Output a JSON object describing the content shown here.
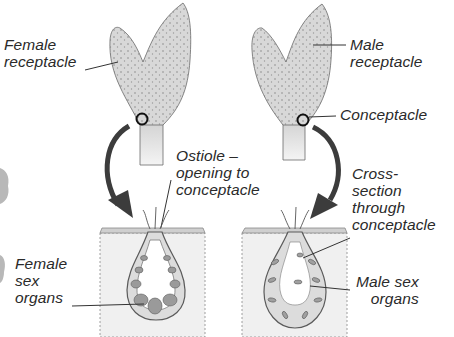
{
  "diagram": {
    "labels": {
      "female_receptacle": "Female\nreceptacle",
      "male_receptacle": "Male\nreceptacle",
      "conceptacle": "Conceptacle",
      "ostiole": "Ostiole –\nopening to\nconceptacle",
      "cross_section": "Cross-\nsection\nthrough\nconceptacle",
      "female_sex_organs": "Female\nsex\norgans",
      "male_sex_organs": "Male sex\norgans"
    },
    "colors": {
      "receptacle_fill": "#d6d6d6",
      "receptacle_dots": "#8a8a8a",
      "outline": "#5a5a5a",
      "arrow": "#3c3c3c",
      "tissue_fill": "#e6e6e6",
      "organ_fill": "#9a9a9a",
      "text": "#2a2a2a"
    }
  }
}
